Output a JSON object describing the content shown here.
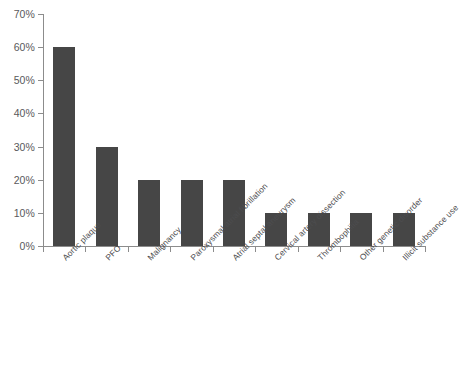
{
  "chart_data": {
    "type": "bar",
    "title": "",
    "xlabel": "",
    "ylabel": "",
    "ylim": [
      0,
      70
    ],
    "grid": false,
    "legend": false,
    "bar_color": "#464646",
    "axis_color": "#8c8c8c",
    "tick_label_color": "#59595b",
    "category_label_color": "#4d4d4f",
    "category_label_rotation": -45,
    "y_tick_labels": [
      "0%",
      "10%",
      "20%",
      "30%",
      "40%",
      "50%",
      "60%",
      "70%"
    ],
    "y_tick_values": [
      0,
      10,
      20,
      30,
      40,
      50,
      60,
      70
    ],
    "categories": [
      "Aortic plaque",
      "PFO",
      "Malignancy",
      "Paroxysmal atrial fibrillation",
      "Atrial septal aneurysm",
      "Cervical artery dissection",
      "Thrombophilia",
      "Other genetic disorder",
      "Illicit substance use"
    ],
    "values": [
      60,
      30,
      20,
      20,
      20,
      10,
      10,
      10,
      10
    ],
    "value_labels": [
      "60%",
      "30%",
      "20%",
      "20%",
      "20%",
      "10%",
      "10%",
      "10%",
      "10%"
    ]
  }
}
